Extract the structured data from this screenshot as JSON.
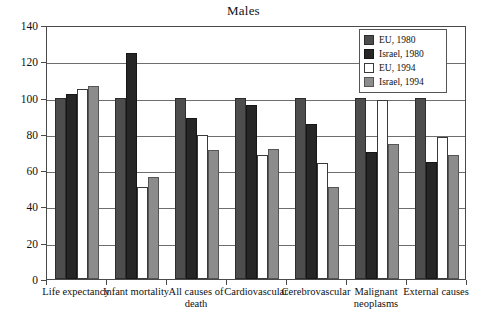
{
  "chart_data": {
    "type": "bar",
    "title": "Males",
    "xlabel": "",
    "ylabel": "",
    "ylim": [
      0,
      140
    ],
    "yticks": [
      0,
      20,
      40,
      60,
      80,
      100,
      120,
      140
    ],
    "grid": true,
    "legend_position": "top-right",
    "categories": [
      "Life expectancy",
      "Infant mortality",
      "All causes of death",
      "Cardiovascular",
      "Cerebrovascular",
      "Malignant neoplasms",
      "External causes"
    ],
    "series": [
      {
        "name": "EU, 1980",
        "color": "#4d4d4d",
        "values": [
          100,
          100,
          100,
          100,
          100,
          100,
          100
        ]
      },
      {
        "name": "Israel, 1980",
        "color": "#262626",
        "values": [
          102,
          124.5,
          89,
          96,
          85.5,
          70,
          64.5
        ]
      },
      {
        "name": "EU, 1994",
        "color": "#ffffff",
        "values": [
          104.5,
          50.5,
          79.5,
          68.5,
          64,
          98.5,
          78.5
        ]
      },
      {
        "name": "Israel, 1994",
        "color": "#8c8c8c",
        "values": [
          106.5,
          56.5,
          71,
          71.5,
          50.5,
          74.5,
          68.5
        ]
      }
    ]
  },
  "axis": {
    "y_tick_labels": [
      "140",
      "120",
      "100",
      "80",
      "60",
      "40",
      "20",
      "0"
    ]
  },
  "category_lines": [
    [
      "Life expectancy"
    ],
    [
      "Infant mortality"
    ],
    [
      "All causes of",
      "death"
    ],
    [
      "Cardiovascular"
    ],
    [
      "Cerebrovascular"
    ],
    [
      "Malignant",
      "neoplasms"
    ],
    [
      "External causes"
    ]
  ]
}
